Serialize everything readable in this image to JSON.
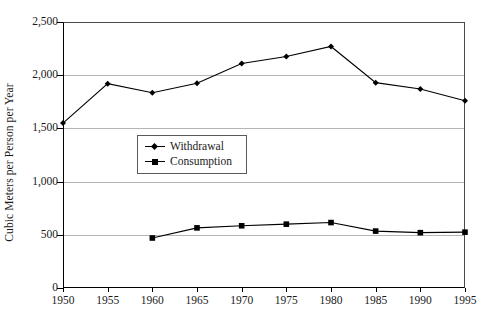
{
  "chart_data": {
    "type": "line",
    "title": "",
    "xlabel": "",
    "ylabel": "Cubic Meters per Person per Year",
    "x": [
      1950,
      1955,
      1960,
      1965,
      1970,
      1975,
      1980,
      1985,
      1990,
      1995
    ],
    "xtick_labels": [
      "1950",
      "1955",
      "1960",
      "1965",
      "1970",
      "1975",
      "1980",
      "1985",
      "1990",
      "1995"
    ],
    "ytick_labels": [
      "0",
      "500",
      "1,000",
      "1,500",
      "2,000",
      "2,500"
    ],
    "ytick_values": [
      0,
      500,
      1000,
      1500,
      2000,
      2500
    ],
    "ylim": [
      0,
      2500
    ],
    "xlim": [
      1950,
      1995
    ],
    "grid": "horizontal",
    "legend_position": "inside-center-left",
    "series": [
      {
        "name": "Withdrawal",
        "marker": "diamond",
        "color": "#000000",
        "x": [
          1950,
          1955,
          1960,
          1965,
          1970,
          1975,
          1980,
          1985,
          1990,
          1995
        ],
        "values": [
          1550,
          1920,
          1835,
          1925,
          2110,
          2175,
          2270,
          1930,
          1870,
          1760
        ]
      },
      {
        "name": "Consumption",
        "marker": "square",
        "color": "#000000",
        "x": [
          1960,
          1965,
          1970,
          1975,
          1980,
          1985,
          1990,
          1995
        ],
        "values": [
          470,
          565,
          585,
          600,
          615,
          535,
          520,
          525
        ]
      }
    ]
  },
  "legend": {
    "entries": [
      {
        "label": "Withdrawal",
        "marker": "diamond"
      },
      {
        "label": "Consumption",
        "marker": "square"
      }
    ]
  },
  "colors": {
    "axis": "#000000",
    "gridline": "#b5b5b5",
    "series": "#000000",
    "background": "#ffffff"
  }
}
